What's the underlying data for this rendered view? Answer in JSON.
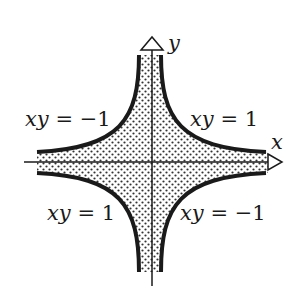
{
  "diagram": {
    "axes": {
      "x_label": "x",
      "y_label": "y"
    },
    "curves": [
      {
        "quadrant": "upper-left",
        "label": "xy = −1",
        "var": "xy",
        "eq": "= −1"
      },
      {
        "quadrant": "upper-right",
        "label": "xy = 1",
        "var": "xy",
        "eq": "= 1"
      },
      {
        "quadrant": "lower-left",
        "label": "xy = 1",
        "var": "xy",
        "eq": "= 1"
      },
      {
        "quadrant": "lower-right",
        "label": "xy = −1",
        "var": "xy",
        "eq": "= −1"
      }
    ],
    "region": {
      "fill": "dotted",
      "description": "|xy| < 1"
    },
    "colors": {
      "ink": "#1a1a1a",
      "background": "#ffffff",
      "dots": "#333333"
    }
  }
}
